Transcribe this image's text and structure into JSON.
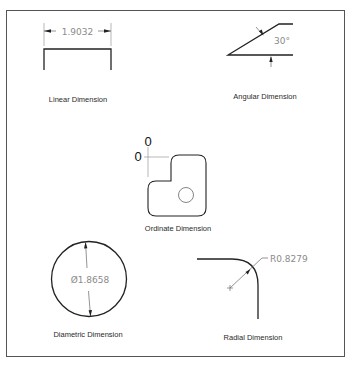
{
  "figure": {
    "frame_color": "#555555",
    "line_color": "#222222",
    "dim_line_color": "#777777",
    "text_color": "#8a8a8a"
  },
  "linear": {
    "caption": "Linear Dimension",
    "value": "1.9032"
  },
  "angular": {
    "caption": "Angular Dimension",
    "value": "30°"
  },
  "ordinate": {
    "caption": "Ordinate Dimension",
    "x_value": "0",
    "y_value": "0"
  },
  "diametric": {
    "caption": "Diametric Dimension",
    "value": "Ø1.8658"
  },
  "radial": {
    "caption": "Radial Dimension",
    "value": "R0.8279"
  }
}
